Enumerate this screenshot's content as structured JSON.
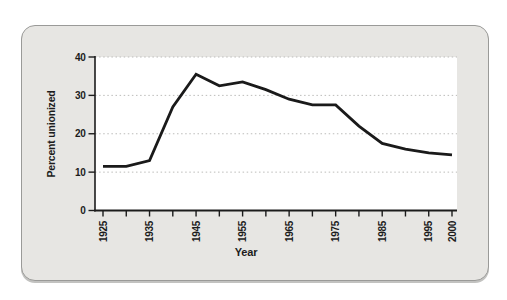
{
  "card": {
    "background_color": "#e7e6e3",
    "border_color": "#9a9a98"
  },
  "chart_data": {
    "type": "line",
    "title": "",
    "xlabel": "Year",
    "ylabel": "Percent unionized",
    "x": [
      1925,
      1930,
      1935,
      1940,
      1945,
      1950,
      1955,
      1960,
      1965,
      1970,
      1975,
      1980,
      1985,
      1990,
      1995,
      2000
    ],
    "values": [
      11.5,
      11.5,
      13,
      27,
      35.5,
      32.5,
      33.5,
      31.5,
      29,
      27.5,
      27.5,
      22,
      17.5,
      16,
      15,
      14.5
    ],
    "xlim": [
      1925,
      2000
    ],
    "ylim": [
      0,
      40
    ],
    "y_ticks": [
      0,
      10,
      20,
      30,
      40
    ],
    "x_tick_interval": 5,
    "x_labeled_ticks": [
      1925,
      1935,
      1945,
      1955,
      1965,
      1975,
      1985,
      1995,
      2000
    ],
    "grid": "horizontal-dotted",
    "legend": "none",
    "line_color": "#1a1a1a",
    "axis_color": "#1c1c1c",
    "grid_color": "#bcbcba",
    "plot_background": "#ffffff"
  }
}
